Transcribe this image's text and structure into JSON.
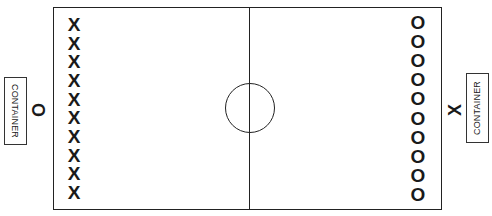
{
  "diagram": {
    "title": "",
    "left_side": {
      "container_label": "CONTAINER",
      "team_marker": "O",
      "players": [
        "X",
        "X",
        "X",
        "X",
        "X",
        "X",
        "X",
        "X",
        "X",
        "X"
      ]
    },
    "right_side": {
      "container_label": "CONTAINER",
      "team_marker": "X",
      "players": [
        "O",
        "O",
        "O",
        "O",
        "O",
        "O",
        "O",
        "O",
        "O",
        "O"
      ]
    },
    "field": {
      "has_center_line": true,
      "has_center_circle": true,
      "line_color": "#222222"
    }
  }
}
